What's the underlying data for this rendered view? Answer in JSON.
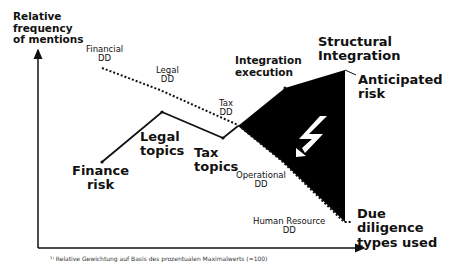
{
  "axes": {
    "y_label": [
      "Relative",
      "frequency",
      "of mentions"
    ],
    "x_label": [
      "Due",
      "diligence",
      "types used"
    ]
  },
  "dd_types": [
    {
      "id": "financial",
      "lines": [
        "Financial",
        "DD"
      ]
    },
    {
      "id": "legal",
      "lines": [
        "Legal",
        "DD"
      ]
    },
    {
      "id": "tax",
      "lines": [
        "Tax",
        "DD"
      ]
    },
    {
      "id": "operational",
      "lines": [
        "Operational",
        "DD"
      ]
    },
    {
      "id": "human_resource",
      "lines": [
        "Human Resource",
        "DD"
      ]
    }
  ],
  "topics": [
    {
      "id": "finance_risk",
      "lines": [
        "Finance",
        "risk"
      ]
    },
    {
      "id": "legal_topics",
      "lines": [
        "Legal",
        "topics"
      ]
    },
    {
      "id": "tax_topics",
      "lines": [
        "Tax",
        "topics"
      ]
    }
  ],
  "integration": {
    "execution": [
      "Integration",
      "execution"
    ],
    "structural": [
      "Structural",
      "Integration"
    ],
    "anticipated_risk": [
      "Anticipated",
      "risk"
    ]
  },
  "symbol": "lightning-arrow-icon",
  "footnote": "¹⁾ Relative Gewichtung auf Basis des prozentualen Maximalwerts (=100)",
  "colors": {
    "ink": "#111111",
    "fill": "#000000",
    "background": "#ffffff"
  }
}
